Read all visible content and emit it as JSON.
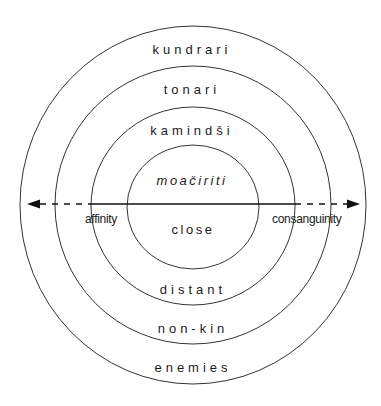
{
  "rings": [
    {
      "top_label": "kundrari",
      "bottom_label": "enemies"
    },
    {
      "top_label": "tonari",
      "bottom_label": "non-kin"
    },
    {
      "top_label": "kamindši",
      "bottom_label": "distant"
    },
    {
      "top_label": "moačiriti",
      "bottom_label": "close"
    }
  ],
  "axis": {
    "left_label": "affinity",
    "right_label": "consanguinity"
  },
  "colors": {
    "line": "#1a1a1a",
    "background": "#ffffff"
  }
}
